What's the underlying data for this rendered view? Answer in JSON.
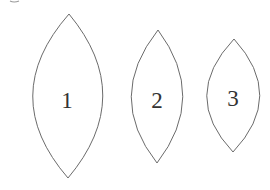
{
  "figure": {
    "shapes": [
      {
        "id": "1",
        "label": "1",
        "shape": "lens"
      },
      {
        "id": "2",
        "label": "2",
        "shape": "lens"
      },
      {
        "id": "3",
        "label": "3",
        "shape": "lens"
      }
    ]
  }
}
